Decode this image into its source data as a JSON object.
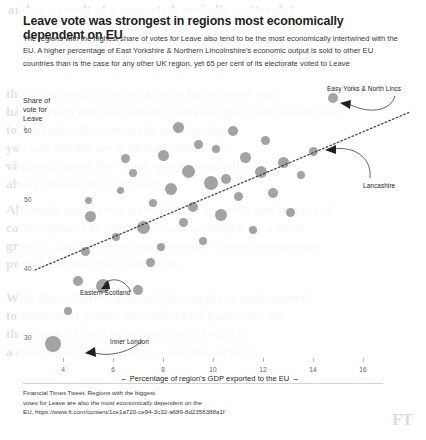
{
  "header": {
    "title": "Leave vote was strongest in regions most economically dependent on EU",
    "subtitle": "The regions with the highest share of votes for Leave also tend to be the most economically intertwined with the EU. A higher percentage of East Yorkshire & Northern Lincolnshire's economic output is sold to other EU countries than is the case for any other UK region, yet 65 per cent of its electorate voted to Leave"
  },
  "footer": {
    "line1": "Financial Times Tweet, Regions with the biggest",
    "line2": "votes for Leave are also the most economically dependent on the",
    "line3": "EU, https://www.ft.com/content/1ce1a720-ce94-3c32-a689-8d2356388a1f",
    "logo": "FT"
  },
  "background_text": [
    "and as a result of a suggested, periodic scatterplot",
    "the chart reveals this as a clear trend: once you",
    "have picked out the pattern that emerges from bottom left",
    "to top right, there is in the relationship",
    "you can hardly see it on both axes. The",
    "visualisation of the chart space, there will",
    "always be the two variables.",
    "Although not every vertical bar is a visible and inspected",
    "catastrophe. The single line was swamped by a nasty",
    "graphic, but during a multi-country dense comparison",
    "period and the chart correctly.",
    "With these figures in mind the sample is undermined",
    "to individual points, the individual points are not",
    "thousands of strikes points, each of which",
    "a chart layer would bury — but not a twist."
  ],
  "chart_data": {
    "type": "scatter",
    "title": "Leave vote was strongest in regions most economically dependent on EU",
    "xlabel": "← Percentage of region's GDP exported to the EU →",
    "ylabel": "Share of\nvote for\nLeave\n↓",
    "xlim": [
      2.8,
      17.2
    ],
    "ylim": [
      26,
      68
    ],
    "xticks": [
      4,
      6,
      8,
      10,
      12,
      14,
      16
    ],
    "yticks": [
      60,
      50,
      40,
      30
    ],
    "grid": false,
    "legend": null,
    "marker_color": "#8c8c8c",
    "trendline": {
      "type": "dotted-linear",
      "x0": 3.1,
      "y0": 41.5,
      "x1": 17.0,
      "y1": 59.8
    },
    "points": [
      {
        "x": 3.6,
        "y": 29.2,
        "size": 16,
        "label": "Inner London"
      },
      {
        "x": 4.2,
        "y": 33.9,
        "size": 8
      },
      {
        "x": 4.6,
        "y": 38.2,
        "size": 10
      },
      {
        "x": 4.9,
        "y": 42.5,
        "size": 9
      },
      {
        "x": 5.1,
        "y": 47.6,
        "size": 11
      },
      {
        "x": 5.0,
        "y": 50.0,
        "size": 7
      },
      {
        "x": 5.6,
        "y": 37.6,
        "size": 14,
        "label": "Eastern Scotland"
      },
      {
        "x": 6.1,
        "y": 44.6,
        "size": 8
      },
      {
        "x": 6.3,
        "y": 51.4,
        "size": 7
      },
      {
        "x": 6.5,
        "y": 56.0,
        "size": 9
      },
      {
        "x": 6.8,
        "y": 53.9,
        "size": 8
      },
      {
        "x": 7.0,
        "y": 37.0,
        "size": 10
      },
      {
        "x": 7.2,
        "y": 46.0,
        "size": 13
      },
      {
        "x": 7.5,
        "y": 41.0,
        "size": 9
      },
      {
        "x": 7.6,
        "y": 49.6,
        "size": 8
      },
      {
        "x": 7.9,
        "y": 43.2,
        "size": 8
      },
      {
        "x": 8.0,
        "y": 56.5,
        "size": 11
      },
      {
        "x": 8.3,
        "y": 51.6,
        "size": 12
      },
      {
        "x": 8.6,
        "y": 60.5,
        "size": 11
      },
      {
        "x": 8.8,
        "y": 46.8,
        "size": 9
      },
      {
        "x": 9.0,
        "y": 54.2,
        "size": 13
      },
      {
        "x": 9.2,
        "y": 49.0,
        "size": 10
      },
      {
        "x": 9.4,
        "y": 58.0,
        "size": 9
      },
      {
        "x": 9.6,
        "y": 44.0,
        "size": 8
      },
      {
        "x": 9.9,
        "y": 52.5,
        "size": 14
      },
      {
        "x": 10.1,
        "y": 57.4,
        "size": 8
      },
      {
        "x": 10.3,
        "y": 47.8,
        "size": 12
      },
      {
        "x": 10.5,
        "y": 53.1,
        "size": 10
      },
      {
        "x": 10.8,
        "y": 60.0,
        "size": 10
      },
      {
        "x": 11.0,
        "y": 50.5,
        "size": 9
      },
      {
        "x": 11.3,
        "y": 56.2,
        "size": 11
      },
      {
        "x": 11.6,
        "y": 45.6,
        "size": 8
      },
      {
        "x": 11.9,
        "y": 54.0,
        "size": 12
      },
      {
        "x": 12.1,
        "y": 58.6,
        "size": 9
      },
      {
        "x": 12.4,
        "y": 51.0,
        "size": 10
      },
      {
        "x": 12.8,
        "y": 55.4,
        "size": 11,
        "label": "Lancashire"
      },
      {
        "x": 13.1,
        "y": 48.2,
        "size": 9
      },
      {
        "x": 13.5,
        "y": 53.6,
        "size": 8
      },
      {
        "x": 14.0,
        "y": 57.0,
        "size": 9
      },
      {
        "x": 14.8,
        "y": 64.8,
        "size": 10,
        "label": "Easy Yorks & North Lincs"
      }
    ],
    "annotations": [
      {
        "text": "Easy Yorks & North Lincs",
        "tx": 327,
        "ty": 85,
        "px": 336,
        "py": 100
      },
      {
        "text": "Lancashire",
        "tx": 363,
        "ty": 182,
        "px": 322,
        "py": 152
      },
      {
        "text": "Eastern Scotland",
        "tx": 80,
        "ty": 289,
        "px": 125,
        "py": 288
      },
      {
        "text": "Inner London",
        "tx": 110,
        "ty": 338,
        "px": 70,
        "py": 352
      }
    ]
  }
}
